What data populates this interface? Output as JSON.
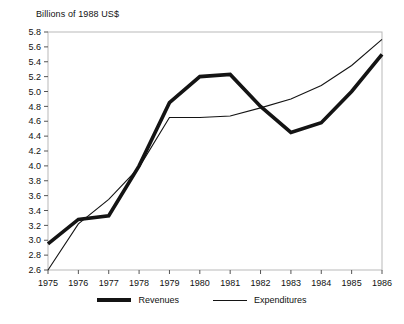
{
  "chart_data": {
    "type": "line",
    "title": "Billions of 1988 US$",
    "xlabel": "",
    "ylabel": "",
    "x": [
      1975,
      1976,
      1977,
      1978,
      1979,
      1980,
      1981,
      1982,
      1983,
      1984,
      1985,
      1986
    ],
    "categories": [
      "1975",
      "1976",
      "1977",
      "1978",
      "1979",
      "1980",
      "1981",
      "1982",
      "1983",
      "1984",
      "1985",
      "1986"
    ],
    "xlim": [
      1975,
      1986
    ],
    "ylim": [
      2.6,
      5.8
    ],
    "ytick_labels": [
      "5.8",
      "5.6",
      "5.4",
      "5.2",
      "5.0",
      "4.8",
      "4.6",
      "4.4",
      "4.2",
      "4.0",
      "3.8",
      "3.6",
      "3.4",
      "3.2",
      "3.0",
      "2.8",
      "2.6"
    ],
    "ytick_values": [
      5.8,
      5.6,
      5.4,
      5.2,
      5.0,
      4.8,
      4.6,
      4.4,
      4.2,
      4.0,
      3.8,
      3.6,
      3.4,
      3.2,
      3.0,
      2.8,
      2.6
    ],
    "grid": false,
    "legend_position": "bottom",
    "series": [
      {
        "name": "Revenues",
        "style": "thick",
        "color": "#141414",
        "values": [
          2.95,
          3.28,
          3.33,
          4.0,
          4.85,
          5.2,
          5.23,
          4.8,
          4.45,
          4.58,
          5.0,
          5.5
        ]
      },
      {
        "name": "Expenditures",
        "style": "thin",
        "color": "#141414",
        "values": [
          2.6,
          3.22,
          3.55,
          3.98,
          4.65,
          4.65,
          4.67,
          4.78,
          4.9,
          5.08,
          5.35,
          5.7
        ]
      }
    ]
  },
  "legend": {
    "entries": [
      {
        "label": "Revenues"
      },
      {
        "label": "Expenditures"
      }
    ]
  }
}
